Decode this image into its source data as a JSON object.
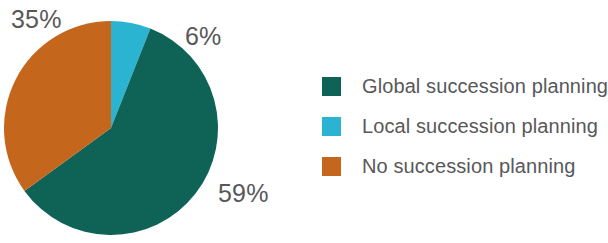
{
  "chart_data": {
    "type": "pie",
    "title": "",
    "subtitle": "",
    "xlabel": "",
    "ylabel": "",
    "grid": false,
    "legend_position": "right",
    "start_angle_deg": 0,
    "direction": "clockwise",
    "categories": [
      "Local succession planning",
      "Global succession planning",
      "No succession planning"
    ],
    "values": [
      6,
      59,
      35
    ],
    "data_labels": [
      "6%",
      "59%",
      "35%"
    ],
    "slices": [
      {
        "label": "Local succession planning",
        "value": 6,
        "data_label": "6%",
        "color": "#2ab4d2",
        "start_deg": 0,
        "end_deg": 21.6
      },
      {
        "label": "Global succession planning",
        "value": 59,
        "data_label": "59%",
        "color": "#0e6356",
        "start_deg": 21.6,
        "end_deg": 234.0
      },
      {
        "label": "No succession planning",
        "value": 35,
        "data_label": "35%",
        "color": "#c4661c",
        "start_deg": 234.0,
        "end_deg": 360.0
      }
    ]
  },
  "labels": {
    "orange_pct": "35%",
    "cyan_pct": "6%",
    "green_pct": "59%"
  },
  "legend": {
    "items": [
      {
        "label": "Global succession planning",
        "color": "#0e6356"
      },
      {
        "label": "Local succession planning",
        "color": "#2ab4d2"
      },
      {
        "label": "No succession planning",
        "color": "#c4661c"
      }
    ]
  },
  "colors": {
    "green": "#0e6356",
    "cyan": "#2ab4d2",
    "orange": "#c4661c",
    "text": "#58585a",
    "background": "#ffffff"
  }
}
